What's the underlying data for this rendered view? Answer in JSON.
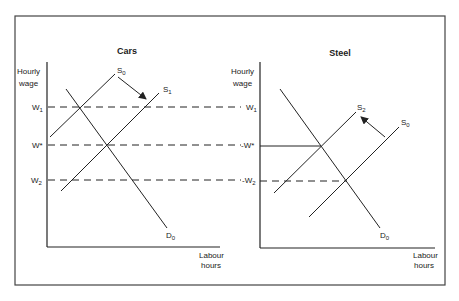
{
  "left_chart": {
    "title": "Cars",
    "y_label_line1": "Hourly",
    "y_label_line2": "wage",
    "x_label_line1": "Labour",
    "x_label_line2": "hours",
    "wage_labels": {
      "w1": "W",
      "w1_sub": "1",
      "wstar": "W*",
      "w2": "W",
      "w2_sub": "2"
    },
    "curves": {
      "s0": {
        "label": "S",
        "sub": "0"
      },
      "s1": {
        "label": "S",
        "sub": "1"
      },
      "d0": {
        "label": "D",
        "sub": "0"
      }
    }
  },
  "right_chart": {
    "title": "Steel",
    "y_label_line1": "Hourly",
    "y_label_line2": "wage",
    "x_label_line1": "Labour",
    "x_label_line2": "hours",
    "wage_labels": {
      "w1": "W",
      "w1_sub": "1",
      "wstar": "-W*",
      "w2": "-W",
      "w2_sub": "2"
    },
    "curves": {
      "s2": {
        "label": "S",
        "sub": "2"
      },
      "s0": {
        "label": "S",
        "sub": "0"
      },
      "d0": {
        "label": "D",
        "sub": "0"
      }
    }
  },
  "colors": {
    "line": "#222222",
    "frame": "#444444",
    "background": "#ffffff"
  }
}
